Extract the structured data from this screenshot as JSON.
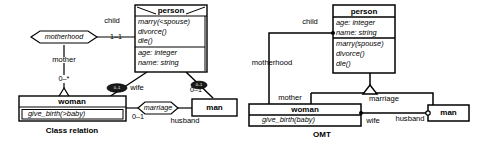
{
  "figure": {
    "background_color": "#ffffff",
    "line_color": "#000000"
  },
  "left_diagram": {
    "caption": "Class relation",
    "person_class": {
      "name": "person",
      "operations": [
        "marry(<spouse)",
        "divorce()",
        "die()"
      ],
      "attributes": [
        "age: integer",
        "name: string"
      ]
    },
    "woman_class": {
      "name": "woman",
      "operations": [
        "give_birth(>baby)"
      ]
    },
    "man_class": {
      "name": "man"
    },
    "associations": {
      "motherhood": "motherhood",
      "marriage": "marriage"
    },
    "roles": {
      "child": "child",
      "mother": "mother",
      "wife": "wife",
      "husband": "husband"
    },
    "multiplicities": {
      "child_end": "1–1",
      "mother_end": "0–*",
      "wife_end": "0–1",
      "husband_end": "0–1"
    },
    "line_markers": {
      "wife_marker": "0..1",
      "husband_marker": "0..1"
    }
  },
  "right_diagram": {
    "caption": "OMT",
    "person_class": {
      "name": "person",
      "attributes": [
        "age: integer",
        "name: string"
      ],
      "operations": [
        "marry(spouse)",
        "divorce()",
        "die()"
      ]
    },
    "woman_class": {
      "name": "woman",
      "operations": [
        "give_birth(baby)"
      ]
    },
    "man_class": {
      "name": "man"
    },
    "associations": {
      "motherhood": "motherhood",
      "marriage": "marriage"
    },
    "roles": {
      "child": "child",
      "mother": "mother",
      "wife": "wife",
      "husband": "husband"
    }
  }
}
